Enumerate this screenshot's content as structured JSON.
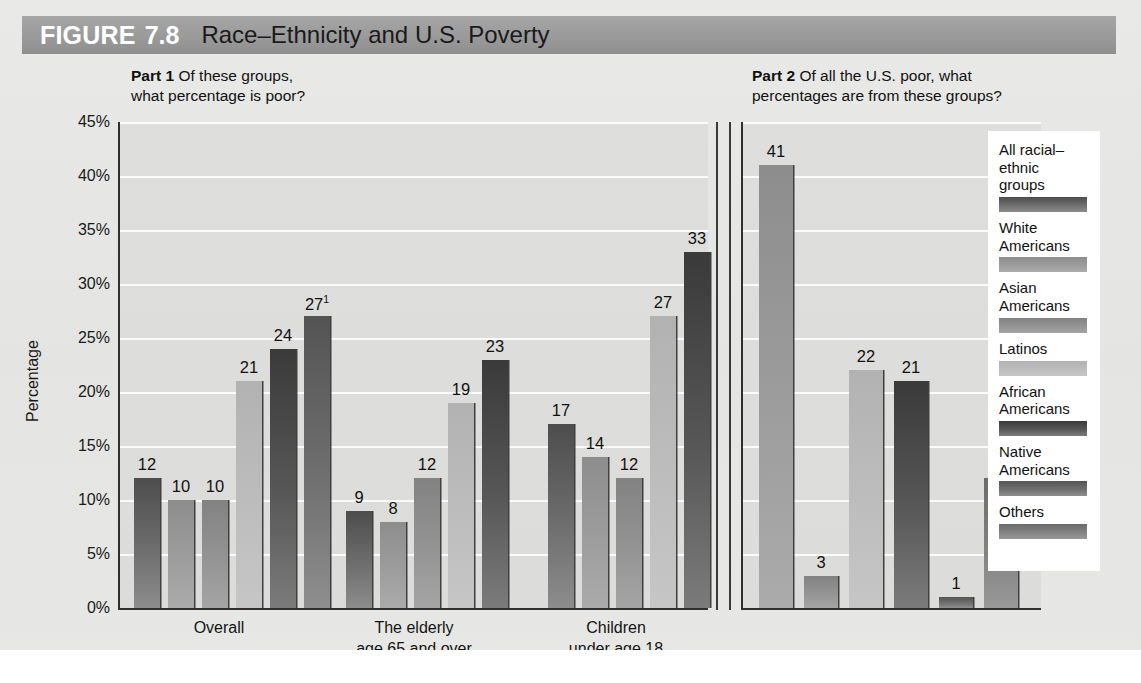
{
  "figure": {
    "label": "FIGURE",
    "number": "7.8",
    "title": "Race–Ethnicity and U.S. Poverty"
  },
  "parts": {
    "part1": {
      "tag": "Part 1",
      "text": " Of these groups,\nwhat percentage is poor?"
    },
    "part2": {
      "tag": "Part 2",
      "text": " Of all the U.S. poor, what\npercentages are from these groups?"
    }
  },
  "axis": {
    "ylabel": "Percentage",
    "yticks": [
      "45%",
      "40%",
      "35%",
      "30%",
      "25%",
      "20%",
      "15%",
      "10%",
      "5%",
      "0%"
    ]
  },
  "legend": {
    "items": [
      {
        "label": "All racial–\nethnic\ngroups",
        "color": "#6e6e6e",
        "key": "all"
      },
      {
        "label": "White\nAmericans",
        "color": "#9d9d9d",
        "key": "white"
      },
      {
        "label": "Asian\nAmericans",
        "color": "#949494",
        "key": "asian"
      },
      {
        "label": "Latinos",
        "color": "#bdbdbd",
        "key": "latino"
      },
      {
        "label": "African\nAmericans",
        "color": "#575757",
        "key": "africa"
      },
      {
        "label": "Native\nAmericans",
        "color": "#6f6f6f",
        "key": "native"
      },
      {
        "label": "Others",
        "color": "#828282",
        "key": "other"
      }
    ]
  },
  "chart_data": {
    "type": "bar",
    "title": "Race–Ethnicity and U.S. Poverty",
    "ylabel": "Percentage",
    "xlabel": "",
    "ylim": [
      0,
      45
    ],
    "grid": true,
    "legend_position": "right",
    "panels": [
      {
        "name": "Part 1",
        "question": "Of these groups, what percentage is poor?",
        "categories": [
          "Overall",
          "The elderly\nage 65 and over",
          "Children\nunder age 18"
        ],
        "series": [
          {
            "name": "All racial–ethnic groups",
            "key": "all",
            "values": [
              12,
              9,
              17
            ]
          },
          {
            "name": "White Americans",
            "key": "white",
            "values": [
              10,
              8,
              14
            ]
          },
          {
            "name": "Asian Americans",
            "key": "asian",
            "values": [
              10,
              null,
              12
            ]
          },
          {
            "name": "Latinos",
            "key": "latino",
            "values": [
              21,
              12,
              27
            ]
          },
          {
            "name": "African Americans",
            "key": "africa",
            "values": [
              24,
              19,
              33
            ]
          },
          {
            "name": "Native Americans",
            "key": "native",
            "values": [
              27,
              23,
              null
            ]
          }
        ],
        "bars": [
          {
            "group": 0,
            "key": "all",
            "value": 12,
            "label": "12",
            "note": ""
          },
          {
            "group": 0,
            "key": "white",
            "value": 10,
            "label": "10",
            "note": ""
          },
          {
            "group": 0,
            "key": "asian",
            "value": 10,
            "label": "10",
            "note": ""
          },
          {
            "group": 0,
            "key": "latino",
            "value": 21,
            "label": "21",
            "note": ""
          },
          {
            "group": 0,
            "key": "africa",
            "value": 24,
            "label": "24",
            "note": ""
          },
          {
            "group": 0,
            "key": "native",
            "value": 27,
            "label": "27",
            "note": "1"
          },
          {
            "group": 1,
            "key": "all",
            "value": 9,
            "label": "9",
            "note": ""
          },
          {
            "group": 1,
            "key": "white",
            "value": 8,
            "label": "8",
            "note": ""
          },
          {
            "group": 1,
            "key": "asian",
            "value": 12,
            "label": "12",
            "note": ""
          },
          {
            "group": 1,
            "key": "latino",
            "value": 19,
            "label": "19",
            "note": ""
          },
          {
            "group": 1,
            "key": "africa",
            "value": 23,
            "label": "23",
            "note": ""
          },
          {
            "group": 2,
            "key": "all",
            "value": 17,
            "label": "17",
            "note": ""
          },
          {
            "group": 2,
            "key": "white",
            "value": 14,
            "label": "14",
            "note": ""
          },
          {
            "group": 2,
            "key": "asian",
            "value": 12,
            "label": "12",
            "note": ""
          },
          {
            "group": 2,
            "key": "latino",
            "value": 27,
            "label": "27",
            "note": ""
          },
          {
            "group": 2,
            "key": "africa",
            "value": 33,
            "label": "33",
            "note": ""
          }
        ]
      },
      {
        "name": "Part 2",
        "question": "Of all the U.S. poor, what percentages are from these groups?",
        "categories": [
          ""
        ],
        "bars": [
          {
            "key": "white",
            "value": 41,
            "label": "41",
            "note": ""
          },
          {
            "key": "asian",
            "value": 3,
            "label": "3",
            "note": ""
          },
          {
            "key": "latino",
            "value": 22,
            "label": "22",
            "note": ""
          },
          {
            "key": "africa",
            "value": 21,
            "label": "21",
            "note": ""
          },
          {
            "key": "native",
            "value": 1,
            "label": "1",
            "note": ""
          },
          {
            "key": "other",
            "value": 12,
            "label": "12",
            "note": "2"
          }
        ]
      }
    ]
  }
}
